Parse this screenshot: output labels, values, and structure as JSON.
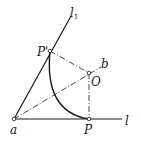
{
  "diagram": {
    "title": "",
    "points": [
      {
        "id": "a",
        "label": "a",
        "x": 14,
        "y": 119
      },
      {
        "id": "P",
        "label": "P",
        "x": 89,
        "y": 119
      },
      {
        "id": "O",
        "label": "O",
        "x": 89,
        "y": 73
      },
      {
        "id": "P_prime",
        "label": "P'",
        "x": 50,
        "y": 51
      }
    ],
    "lines": [
      {
        "id": "l",
        "label": "l",
        "from": "a",
        "to_x": 122,
        "to_y": 119,
        "style": "solid"
      },
      {
        "id": "l1",
        "label": "l",
        "subscript": "1",
        "from": "a",
        "to_x": 71,
        "to_y": 16,
        "style": "solid"
      },
      {
        "id": "b",
        "label": "b",
        "from": "a",
        "to_x": 101,
        "to_y": 67,
        "style": "dash-dot"
      }
    ],
    "segments": [
      {
        "from": "P_prime",
        "to": "O",
        "style": "dash-dot"
      },
      {
        "from": "O",
        "to": "P",
        "style": "dash-dot"
      }
    ],
    "arc": {
      "center": "O",
      "from": "P",
      "to": "P_prime",
      "description": "arc from P to P' bulging toward a"
    },
    "labels": {
      "a": "a",
      "P": "P",
      "P_prime": "P'",
      "O": "O",
      "b": "b",
      "l": "l",
      "l1_main": "l",
      "l1_sub": "1"
    },
    "colors": {
      "stroke": "#1a1a1a",
      "background": "#ffffff"
    }
  }
}
